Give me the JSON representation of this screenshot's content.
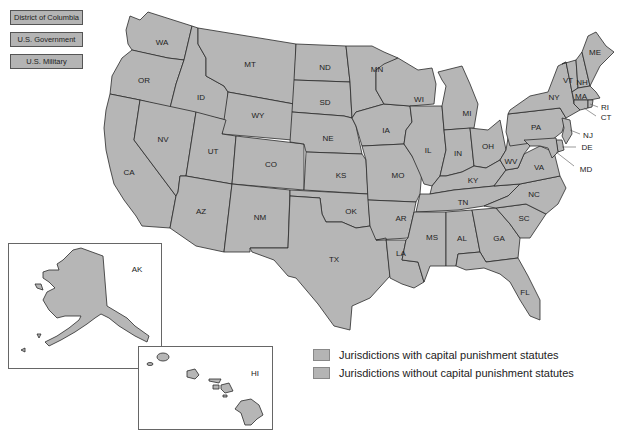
{
  "side_boxes": [
    {
      "label": "District of Columbia"
    },
    {
      "label": "U.S. Government"
    },
    {
      "label": "U.S. Military"
    }
  ],
  "states": {
    "WA": "WA",
    "OR": "OR",
    "CA": "CA",
    "ID": "ID",
    "NV": "NV",
    "MT": "MT",
    "WY": "WY",
    "UT": "UT",
    "AZ": "AZ",
    "CO": "CO",
    "NM": "NM",
    "ND": "ND",
    "SD": "SD",
    "NE": "NE",
    "KS": "KS",
    "OK": "OK",
    "TX": "TX",
    "MN": "MN",
    "IA": "IA",
    "MO": "MO",
    "AR": "AR",
    "LA": "LA",
    "WI": "WI",
    "IL": "IL",
    "MI": "MI",
    "IN": "IN",
    "OH": "OH",
    "KY": "KY",
    "TN": "TN",
    "MS": "MS",
    "AL": "AL",
    "GA": "GA",
    "FL": "FL",
    "SC": "SC",
    "NC": "NC",
    "VA": "VA",
    "WV": "WV",
    "PA": "PA",
    "NY": "NY",
    "VT": "VT",
    "NH": "NH",
    "ME": "ME",
    "MA": "MA",
    "RI": "RI",
    "CT": "CT",
    "NJ": "NJ",
    "DE": "DE",
    "MD": "MD",
    "AK": "AK",
    "HI": "HI"
  },
  "legend": [
    {
      "label": "Jurisdictions with capital punishment statutes",
      "color": "#b4b4b4"
    },
    {
      "label": "Jurisdictions without capital punishment statutes",
      "color": "#b4b4b4"
    }
  ],
  "colors": {
    "state_fill": "#b6b6b6",
    "border": "#2a2a2a",
    "background": "#ffffff"
  }
}
